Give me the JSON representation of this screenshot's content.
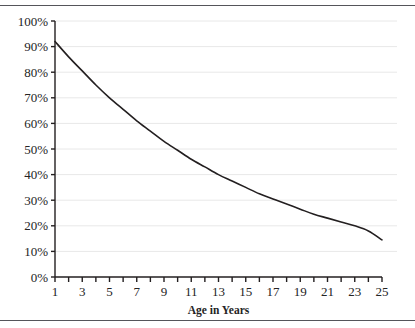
{
  "figure": {
    "name": "age-decline-line-chart",
    "has_top_rule": true,
    "has_bottom_rule": true,
    "rule_color": "#55555a",
    "background": "#ffffff"
  },
  "chart_data": {
    "type": "line",
    "title": "",
    "subtitle": "",
    "xlabel": "Age in Years",
    "ylabel": "",
    "xlim": [
      1,
      25
    ],
    "ylim": [
      0,
      100
    ],
    "grid": true,
    "grid_axis": "y",
    "grid_color": "#e8e8e8",
    "legend": false,
    "legend_position": "none",
    "line_color": "#231f20",
    "line_width": 1.6,
    "axis_color": "#231f20",
    "x_tick_interval": 1,
    "x_label_interval": 2,
    "y_tick_interval": 10,
    "x_tick_values": [
      1,
      2,
      3,
      4,
      5,
      6,
      7,
      8,
      9,
      10,
      11,
      12,
      13,
      14,
      15,
      16,
      17,
      18,
      19,
      20,
      21,
      22,
      23,
      24,
      25
    ],
    "x_tick_labels": [
      "1",
      "",
      "3",
      "",
      "5",
      "",
      "7",
      "",
      "9",
      "",
      "11",
      "",
      "13",
      "",
      "15",
      "",
      "17",
      "",
      "19",
      "",
      "21",
      "",
      "23",
      "",
      "25"
    ],
    "y_tick_values": [
      0,
      10,
      20,
      30,
      40,
      50,
      60,
      70,
      80,
      90,
      100
    ],
    "y_tick_labels": [
      "0%",
      "10%",
      "20%",
      "30%",
      "40%",
      "50%",
      "60%",
      "70%",
      "80%",
      "90%",
      "100%"
    ],
    "x": [
      1,
      2,
      3,
      4,
      5,
      6,
      7,
      8,
      9,
      10,
      11,
      12,
      13,
      14,
      15,
      16,
      17,
      18,
      19,
      20,
      21,
      22,
      23,
      24,
      25
    ],
    "values": [
      92,
      86,
      80.5,
      75,
      70,
      65.5,
      61,
      57,
      53,
      49.5,
      46,
      43,
      40,
      37.5,
      35,
      32.5,
      30.5,
      28.5,
      26.5,
      24.5,
      23,
      21.5,
      20,
      18,
      14.5
    ],
    "series": [
      {
        "name": "survival-rate",
        "values": [
          92,
          86,
          80.5,
          75,
          70,
          65.5,
          61,
          57,
          53,
          49.5,
          46,
          43,
          40,
          37.5,
          35,
          32.5,
          30.5,
          28.5,
          26.5,
          24.5,
          23,
          21.5,
          20,
          18,
          14.5
        ]
      }
    ]
  }
}
